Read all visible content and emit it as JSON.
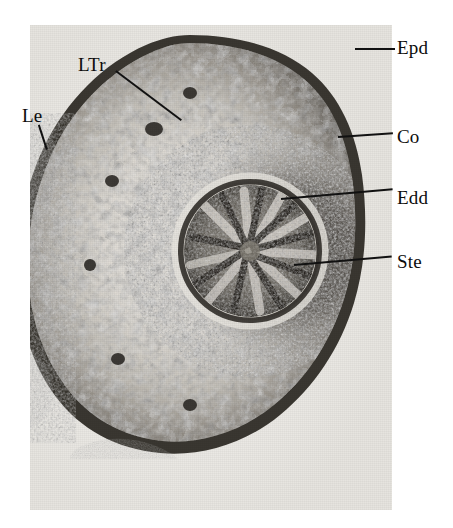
{
  "figure": {
    "type": "light-micrograph",
    "background_color": "#ffffff",
    "plate_color": "#eceae6"
  },
  "labels": [
    {
      "id": "epd",
      "text": "Epd",
      "meaning": "epidermis",
      "x": 397,
      "y": 38,
      "leader": {
        "x": 355,
        "y": 48,
        "length": 40,
        "angle": 0
      }
    },
    {
      "id": "ltr",
      "text": "LTr",
      "meaning": "leaf trace",
      "x": 78,
      "y": 55,
      "leader": {
        "x": 116,
        "y": 70,
        "length": 82,
        "angle": 37
      }
    },
    {
      "id": "le",
      "text": "Le",
      "meaning": "leaf base",
      "x": 22,
      "y": 106,
      "leader": {
        "x": 39,
        "y": 124,
        "length": 26,
        "angle": 72
      }
    },
    {
      "id": "co",
      "text": "Co",
      "meaning": "cortex",
      "x": 397,
      "y": 127,
      "leader": {
        "x": 338,
        "y": 136,
        "length": 55,
        "angle": -4
      }
    },
    {
      "id": "edd",
      "text": "Edd",
      "meaning": "endodermis",
      "x": 397,
      "y": 188,
      "leader": {
        "x": 281,
        "y": 198,
        "length": 112,
        "angle": -5
      }
    },
    {
      "id": "ste",
      "text": "Ste",
      "meaning": "stele",
      "x": 397,
      "y": 252,
      "leader": {
        "x": 294,
        "y": 264,
        "length": 98,
        "angle": -5
      }
    }
  ],
  "anatomy": {
    "epidermis_color": "#2c2a27",
    "cortex_color": "#d8d5cf",
    "endodermis_color": "#3a3733",
    "stele_color": "#4a4641",
    "leaf_base_color": "#38342f"
  }
}
